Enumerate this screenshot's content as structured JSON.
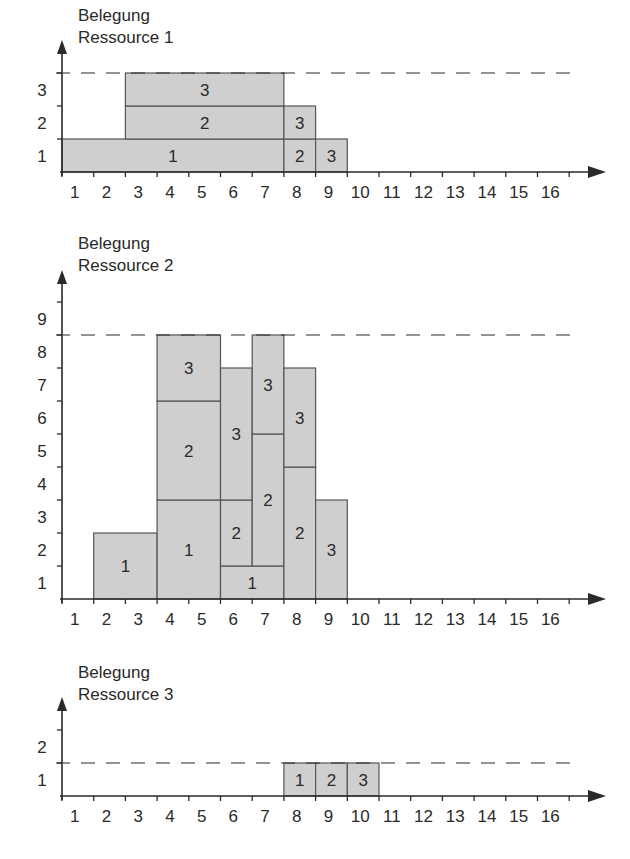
{
  "chart_data": [
    {
      "type": "bar",
      "title": "Belegung Ressource 1",
      "title_lines": [
        "Belegung",
        "Ressource 1"
      ],
      "xlabel": "",
      "ylabel": "Belegung Ressource 1",
      "x_ticks": [
        "1",
        "2",
        "3",
        "4",
        "5",
        "6",
        "7",
        "8",
        "9",
        "10",
        "11",
        "12",
        "13",
        "14",
        "15",
        "16"
      ],
      "y_ticks": [
        "1",
        "2",
        "3"
      ],
      "capacity": 3,
      "ylim": [
        0,
        3
      ],
      "blocks": [
        {
          "label": "1",
          "x_start": 0,
          "x_end": 7,
          "y_start": 0,
          "y_end": 1
        },
        {
          "label": "2",
          "x_start": 2,
          "x_end": 7,
          "y_start": 1,
          "y_end": 2
        },
        {
          "label": "3",
          "x_start": 2,
          "x_end": 7,
          "y_start": 2,
          "y_end": 3
        },
        {
          "label": "2",
          "x_start": 7,
          "x_end": 8,
          "y_start": 0,
          "y_end": 1
        },
        {
          "label": "3",
          "x_start": 7,
          "x_end": 8,
          "y_start": 1,
          "y_end": 2
        },
        {
          "label": "3",
          "x_start": 8,
          "x_end": 9,
          "y_start": 0,
          "y_end": 1
        }
      ]
    },
    {
      "type": "bar",
      "title": "Belegung Ressource 2",
      "title_lines": [
        "Belegung",
        "Ressource 2"
      ],
      "xlabel": "",
      "ylabel": "Belegung Ressource 2",
      "x_ticks": [
        "1",
        "2",
        "3",
        "4",
        "5",
        "6",
        "7",
        "8",
        "9",
        "10",
        "11",
        "12",
        "13",
        "14",
        "15",
        "16"
      ],
      "y_ticks": [
        "1",
        "2",
        "3",
        "4",
        "5",
        "6",
        "7",
        "8",
        "9"
      ],
      "capacity": 8,
      "ylim": [
        0,
        9
      ],
      "blocks": [
        {
          "label": "1",
          "x_start": 1,
          "x_end": 3,
          "y_start": 0,
          "y_end": 2
        },
        {
          "label": "1",
          "x_start": 3,
          "x_end": 5,
          "y_start": 0,
          "y_end": 3
        },
        {
          "label": "2",
          "x_start": 3,
          "x_end": 5,
          "y_start": 3,
          "y_end": 6
        },
        {
          "label": "3",
          "x_start": 3,
          "x_end": 5,
          "y_start": 6,
          "y_end": 8
        },
        {
          "label": "1",
          "x_start": 5,
          "x_end": 7,
          "y_start": 0,
          "y_end": 1
        },
        {
          "label": "2",
          "x_start": 5,
          "x_end": 6,
          "y_start": 1,
          "y_end": 3
        },
        {
          "label": "3",
          "x_start": 5,
          "x_end": 6,
          "y_start": 3,
          "y_end": 7
        },
        {
          "label": "2",
          "x_start": 6,
          "x_end": 7,
          "y_start": 1,
          "y_end": 5
        },
        {
          "label": "3",
          "x_start": 6,
          "x_end": 7,
          "y_start": 5,
          "y_end": 8
        },
        {
          "label": "2",
          "x_start": 7,
          "x_end": 8,
          "y_start": 0,
          "y_end": 4
        },
        {
          "label": "3",
          "x_start": 7,
          "x_end": 8,
          "y_start": 4,
          "y_end": 7
        },
        {
          "label": "3",
          "x_start": 8,
          "x_end": 9,
          "y_start": 0,
          "y_end": 3
        }
      ]
    },
    {
      "type": "bar",
      "title": "Belegung Ressource 3",
      "title_lines": [
        "Belegung",
        "Ressource 3"
      ],
      "xlabel": "",
      "ylabel": "Belegung Ressource 3",
      "x_ticks": [
        "1",
        "2",
        "3",
        "4",
        "5",
        "6",
        "7",
        "8",
        "9",
        "10",
        "11",
        "12",
        "13",
        "14",
        "15",
        "16"
      ],
      "y_ticks": [
        "1",
        "2"
      ],
      "capacity": 1,
      "ylim": [
        0,
        2
      ],
      "blocks": [
        {
          "label": "1",
          "x_start": 7,
          "x_end": 8,
          "y_start": 0,
          "y_end": 1
        },
        {
          "label": "2",
          "x_start": 8,
          "x_end": 9,
          "y_start": 0,
          "y_end": 1
        },
        {
          "label": "3",
          "x_start": 9,
          "x_end": 10,
          "y_start": 0,
          "y_end": 1
        }
      ]
    }
  ],
  "style": {
    "block_fill": "#cfcfcf",
    "block_stroke": "#555555",
    "axis_color": "#2a2a2a",
    "dash_color": "#2a2a2a"
  }
}
